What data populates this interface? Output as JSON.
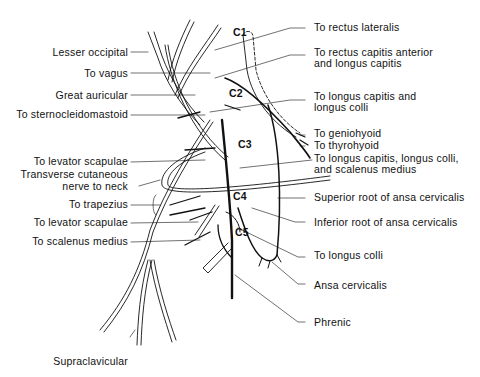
{
  "segments": [
    "C1",
    "C2",
    "C3",
    "C4",
    "C5"
  ],
  "labels_left": [
    {
      "text": "Lesser occipital"
    },
    {
      "text": "To vagus"
    },
    {
      "text": "Great auricular"
    },
    {
      "text": "To sternocleidomastoid"
    },
    {
      "text": "To levator scapulae"
    },
    {
      "line1": "Transverse cutaneous",
      "line2": "nerve to neck"
    },
    {
      "text": "To trapezius"
    },
    {
      "text": "To levator scapulae"
    },
    {
      "text": "To scalenus medius"
    },
    {
      "text": "Supraclavicular"
    }
  ],
  "labels_right": [
    {
      "text": "To rectus lateralis"
    },
    {
      "line1": "To rectus capitis anterior",
      "line2": "and longus capitis"
    },
    {
      "line1": "To longus capitis and",
      "line2": "longus colli"
    },
    {
      "text": "To geniohyoid"
    },
    {
      "text": "To thyrohyoid"
    },
    {
      "line1": "To longus capitis, longus colli,",
      "line2": "and scalenus medius"
    },
    {
      "text": "Superior root of ansa cervicalis"
    },
    {
      "text": "Inferior root of ansa cervicalis"
    },
    {
      "text": "To longus colli"
    },
    {
      "text": "Ansa cervicalis"
    },
    {
      "text": "Phrenic"
    }
  ]
}
